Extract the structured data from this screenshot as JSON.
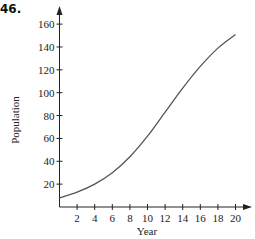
{
  "problem_number": "46.",
  "chart_data": {
    "type": "line",
    "title": "",
    "xlabel": "Year",
    "ylabel": "Population",
    "xlim": [
      0,
      21
    ],
    "ylim": [
      0,
      170
    ],
    "xticks": [
      2,
      4,
      6,
      8,
      10,
      12,
      14,
      16,
      18,
      20
    ],
    "yticks": [
      20,
      40,
      60,
      80,
      100,
      120,
      140,
      160
    ],
    "xtick_labels": [
      "2",
      "4",
      "6",
      "8",
      "10",
      "12",
      "14",
      "16",
      "18",
      "20"
    ],
    "ytick_labels": [
      "20",
      "40",
      "60",
      "80",
      "100",
      "120",
      "140",
      "160"
    ],
    "grid": false,
    "legend": null,
    "series": [
      {
        "name": "Population",
        "x": [
          0,
          2,
          4,
          6,
          8,
          10,
          12,
          14,
          16,
          18,
          20
        ],
        "values": [
          8,
          13,
          20,
          30,
          44,
          62,
          83,
          104,
          123,
          139,
          151
        ]
      }
    ],
    "line_color": "#555555",
    "axis_color": "#222222"
  }
}
